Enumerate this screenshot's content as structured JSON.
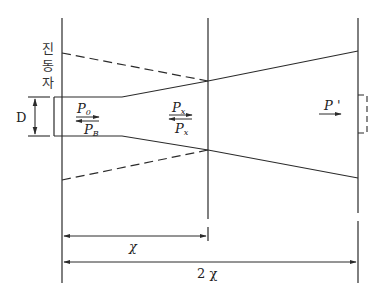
{
  "diagram": {
    "type": "tube-horn-pressure-diagram",
    "vibrator_label": [
      "진",
      "동",
      "자"
    ],
    "diameter_label": "D",
    "tube_labels": {
      "incident": "P",
      "incident_sub": "0",
      "reflected": "P",
      "reflected_sub": "B"
    },
    "mid_labels": {
      "forward": "P",
      "forward_sub": "x",
      "backward": "P",
      "backward_sub": "x"
    },
    "output_label": "P '",
    "dimensions": {
      "first": "χ",
      "second": "2 χ"
    },
    "line_color": "#2b2b2b",
    "background": "#ffffff"
  }
}
